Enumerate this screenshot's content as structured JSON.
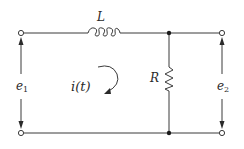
{
  "diagram": {
    "labels": {
      "inductor": "L",
      "resistor": "R",
      "current": "i(t)",
      "input_voltage": {
        "base": "e",
        "sub": "1"
      },
      "output_voltage": {
        "base": "e",
        "sub": "2"
      }
    },
    "components": [
      {
        "type": "inductor",
        "label": "L",
        "position": "series, top wire"
      },
      {
        "type": "resistor",
        "label": "R",
        "position": "shunt, between top and bottom wires"
      }
    ],
    "terminals": [
      "input-top",
      "input-bottom",
      "output-top",
      "output-bottom"
    ],
    "current_direction": "clockwise",
    "colors": {
      "line": "#3a3a3a",
      "background": "#ffffff"
    }
  }
}
